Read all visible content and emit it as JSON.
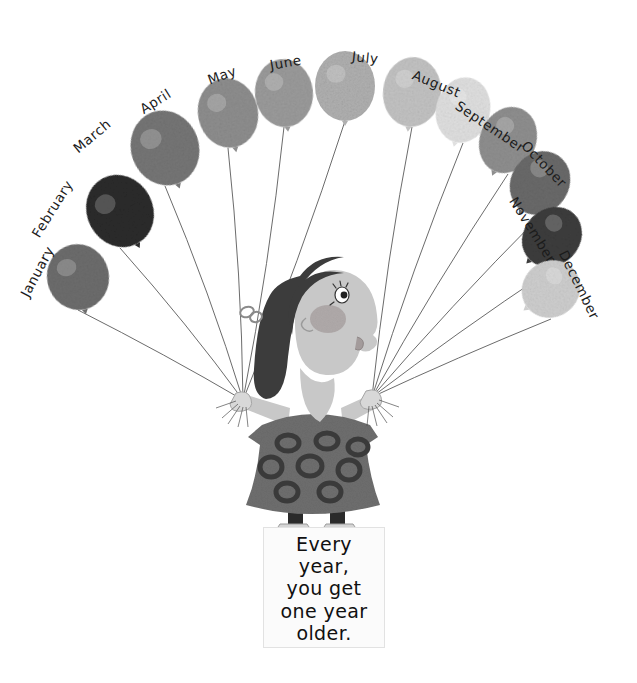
{
  "illustration": {
    "title": "Twelve month balloons held by a girl",
    "background_color": "#ffffff"
  },
  "balloons": [
    {
      "label": "January",
      "color": "#6d6d6d",
      "cx": 78,
      "cy": 277,
      "rx": 31,
      "ry": 33,
      "rot": -12,
      "label_x": 24,
      "label_y": 288,
      "label_rot": -62
    },
    {
      "label": "February",
      "color": "#2b2b2b",
      "cx": 120,
      "cy": 211,
      "rx": 33,
      "ry": 37,
      "rot": -28,
      "label_x": 35,
      "label_y": 228,
      "label_rot": -58
    },
    {
      "label": "March",
      "color": "#767676",
      "cx": 165,
      "cy": 148,
      "rx": 34,
      "ry": 38,
      "rot": -20,
      "label_x": 75,
      "label_y": 142,
      "label_rot": -40
    },
    {
      "label": "April",
      "color": "#8e8e8e",
      "cx": 228,
      "cy": 113,
      "rx": 30,
      "ry": 35,
      "rot": -12,
      "label_x": 141,
      "label_y": 102,
      "label_rot": -32
    },
    {
      "label": "May",
      "color": "#9b9b9b",
      "cx": 284,
      "cy": 93,
      "rx": 29,
      "ry": 34,
      "rot": -6,
      "label_x": 208,
      "label_y": 72,
      "label_rot": -20
    },
    {
      "label": "June",
      "color": "#b0b0b0",
      "cx": 345,
      "cy": 86,
      "rx": 30,
      "ry": 35,
      "rot": 0,
      "label_x": 270,
      "label_y": 57,
      "label_rot": -10
    },
    {
      "label": "July",
      "color": "#c3c3c3",
      "cx": 412,
      "cy": 92,
      "rx": 29,
      "ry": 35,
      "rot": 6,
      "label_x": 352,
      "label_y": 48,
      "label_rot": 6
    },
    {
      "label": "August",
      "color": "#e0e0e0",
      "cx": 463,
      "cy": 110,
      "rx": 27,
      "ry": 33,
      "rot": 14,
      "label_x": 413,
      "label_y": 66,
      "label_rot": 22
    },
    {
      "label": "September",
      "color": "#8f8f8f",
      "cx": 508,
      "cy": 140,
      "rx": 28,
      "ry": 34,
      "rot": 24,
      "label_x": 457,
      "label_y": 96,
      "label_rot": 34
    },
    {
      "label": "October",
      "color": "#6a6a6a",
      "cx": 540,
      "cy": 183,
      "rx": 29,
      "ry": 33,
      "rot": 34,
      "label_x": 524,
      "label_y": 135,
      "label_rot": 46
    },
    {
      "label": "November",
      "color": "#3d3d3d",
      "cx": 552,
      "cy": 237,
      "rx": 28,
      "ry": 32,
      "rot": 44,
      "label_x": 513,
      "label_y": 190,
      "label_rot": 58
    },
    {
      "label": "December",
      "color": "#cfcfcf",
      "cx": 551,
      "cy": 289,
      "rx": 28,
      "ry": 30,
      "rot": 52,
      "label_x": 563,
      "label_y": 243,
      "label_rot": 64
    }
  ],
  "hands": {
    "left": {
      "x": 243,
      "y": 400
    },
    "right": {
      "x": 372,
      "y": 397
    }
  },
  "girl": {
    "skin_color": "#c8c8c8",
    "hair_color": "#3c3c3c",
    "dress_color": "#6e6e6e",
    "dress_dot_color": "#3a3a3a",
    "legging_color": "#2a2a2a",
    "shoe_color": "#d5d5d5",
    "cheek_color": "#a8a0a0",
    "bow_color": "#8a8a8a"
  },
  "quote": {
    "lines": [
      "Every",
      "year,",
      "you get",
      "one year",
      "older."
    ],
    "box_color": "#fbfbfb",
    "text_color": "#101010"
  }
}
